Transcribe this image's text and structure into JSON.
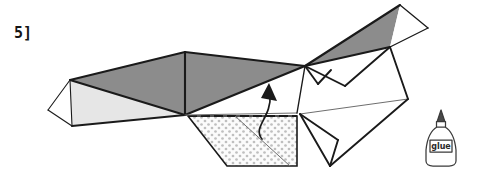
{
  "diagram": {
    "step_label": "5]",
    "colors": {
      "outline": "#1a1a1a",
      "thin_outline": "#555555",
      "dark_gray_face": "#8c8c8c",
      "mid_gray_face": "#9a9a9a",
      "light_gray_face": "#e6e6e6",
      "white_face": "#ffffff",
      "tab_dot": "#bcbcbc",
      "tab_fill": "#fbfbfb",
      "background": "#ffffff",
      "label_color": "#151515"
    },
    "faces": [
      {
        "name": "left-tip-white-face",
        "fill": "#ffffff",
        "points": "48,110 70,80 72,126"
      },
      {
        "name": "left-lower-light-face",
        "fill": "#e6e6e6",
        "points": "70,80 185,115 72,126"
      },
      {
        "name": "left-upper-dark-face",
        "fill": "#8c8c8c",
        "points": "70,80 185,52 185,115"
      },
      {
        "name": "center-dark-face",
        "fill": "#8c8c8c",
        "points": "185,52 305,66 185,115"
      },
      {
        "name": "center-white-face",
        "fill": "#ffffff",
        "points": "185,115 305,66 297,113"
      },
      {
        "name": "upper-right-dark-face",
        "fill": "#8c8c8c",
        "points": "305,66 400,5 390,47"
      },
      {
        "name": "upper-right-white-face",
        "fill": "#ffffff",
        "points": "400,5 428,28 390,47"
      },
      {
        "name": "right-mid-white-face-a",
        "fill": "#ffffff",
        "points": "305,66 390,47 345,86"
      },
      {
        "name": "right-mid-white-face-b",
        "fill": "#ffffff",
        "points": "305,66 345,86 318,84"
      },
      {
        "name": "right-lower-white-face",
        "fill": "#ffffff",
        "points": "305,66 390,47 408,99 300,114"
      },
      {
        "name": "right-bottom-flap-a",
        "fill": "#ffffff",
        "points": "300,114 408,99 330,166"
      },
      {
        "name": "right-bottom-flap-b",
        "fill": "#ffffff",
        "points": "300,114 338,140 330,166"
      }
    ],
    "edges": [
      {
        "name": "edge-left-tip-top",
        "d": "M48,110 L70,80",
        "weight": "thin"
      },
      {
        "name": "edge-left-tip-bottom",
        "d": "M48,110 L72,126",
        "weight": "thin"
      },
      {
        "name": "edge-left-fold-vertical",
        "d": "M70,80 L72,126",
        "weight": "thin"
      },
      {
        "name": "edge-left-top-long",
        "d": "M70,80 L185,52",
        "weight": "bold"
      },
      {
        "name": "edge-left-bottom-long",
        "d": "M72,126 L185,115",
        "weight": "bold"
      },
      {
        "name": "edge-left-diagonal",
        "d": "M70,80 L185,115",
        "weight": "bold"
      },
      {
        "name": "edge-center-fold-vertical",
        "d": "M185,52 L185,115",
        "weight": "bold"
      },
      {
        "name": "edge-center-top",
        "d": "M185,52 L305,66",
        "weight": "bold"
      },
      {
        "name": "edge-center-diagonal",
        "d": "M185,115 L305,66",
        "weight": "bold"
      },
      {
        "name": "edge-center-bottom",
        "d": "M185,115 L297,113",
        "weight": "thin"
      },
      {
        "name": "edge-upper-right-dark-top",
        "d": "M305,66 L400,5",
        "weight": "bold"
      },
      {
        "name": "edge-upper-right-dark-bottom",
        "d": "M305,66 L390,47",
        "weight": "bold"
      },
      {
        "name": "edge-upper-right-apex-right",
        "d": "M400,5 L428,28",
        "weight": "thin"
      },
      {
        "name": "edge-upper-right-right-down",
        "d": "M428,28 L390,47",
        "weight": "thin"
      },
      {
        "name": "edge-right-zig-down",
        "d": "M305,66 L345,86",
        "weight": "bold"
      },
      {
        "name": "edge-right-zig-up",
        "d": "M345,86 L390,47",
        "weight": "bold"
      },
      {
        "name": "edge-right-small-v-a",
        "d": "M305,66 L318,84",
        "weight": "bold"
      },
      {
        "name": "edge-right-small-v-b",
        "d": "M318,84 L330,70",
        "weight": "bold"
      },
      {
        "name": "edge-right-outer-down",
        "d": "M390,47 L408,99",
        "weight": "bold"
      },
      {
        "name": "edge-right-thin-long",
        "d": "M300,114 L408,99",
        "weight": "thin"
      },
      {
        "name": "edge-right-bottom-left",
        "d": "M300,114 L330,166",
        "weight": "bold"
      },
      {
        "name": "edge-right-bottom-right",
        "d": "M330,166 L408,99",
        "weight": "bold"
      },
      {
        "name": "edge-right-inner-flap-a",
        "d": "M300,114 L338,140",
        "weight": "bold"
      },
      {
        "name": "edge-right-inner-flap-b",
        "d": "M338,140 L330,166",
        "weight": "bold"
      },
      {
        "name": "edge-center-stub-up",
        "d": "M297,113 L305,66",
        "weight": "thin"
      }
    ],
    "glue_tab": {
      "name": "glue-tab",
      "points": "188,116 297,116 297,166 227,166",
      "dashed_top": "M188,116 L297,116",
      "note": "dotted stipple glue tab"
    },
    "fold_arrow": {
      "name": "fold-arrow",
      "path": "M263,140 C252,128 273,118 271,96",
      "head": "266,84 276,100 262,99",
      "direction": "up"
    },
    "glue_bottle": {
      "name": "glue-bottle-icon",
      "label": "glue",
      "x": 424,
      "y": 108
    }
  }
}
